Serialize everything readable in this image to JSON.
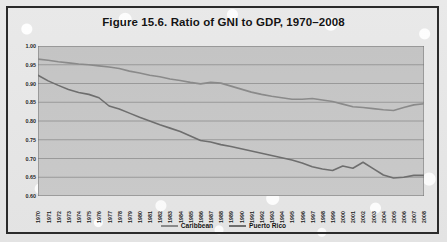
{
  "figure": {
    "title": "Figure 15.6. Ratio of GNI to GDP, 1970–2008",
    "border_color": "#2b2b2b",
    "plot_band_color": "#c6c6c6"
  },
  "legend": {
    "position": "bottom-center",
    "items": [
      {
        "label": "Caribbean",
        "color": "#8a8a8a"
      },
      {
        "label": "Puerto Rico",
        "color": "#6e6e6e"
      }
    ]
  },
  "chart_data": {
    "type": "line",
    "title": "Figure 15.6. Ratio of GNI to GDP, 1970–2008",
    "xlabel": "",
    "ylabel": "",
    "ylim": [
      0.6,
      1.0
    ],
    "ytick_step": 0.05,
    "ytick_labels": [
      "1.00",
      "0.95",
      "0.90",
      "0.85",
      "0.80",
      "0.75",
      "0.70",
      "0.65",
      "0.60"
    ],
    "grid": true,
    "legend_position": "bottom-center",
    "x": [
      1970,
      1971,
      1972,
      1973,
      1974,
      1975,
      1976,
      1977,
      1978,
      1979,
      1980,
      1981,
      1982,
      1983,
      1984,
      1985,
      1986,
      1987,
      1988,
      1989,
      1990,
      1991,
      1992,
      1993,
      1994,
      1995,
      1996,
      1997,
      1998,
      1999,
      2000,
      2001,
      2002,
      2003,
      2004,
      2005,
      2006,
      2007,
      2008
    ],
    "xtick_labels": [
      "1970",
      "1971",
      "1972",
      "1973",
      "1974",
      "1975",
      "1976",
      "1977",
      "1978",
      "1979",
      "1980",
      "1981",
      "1982",
      "1983",
      "1984",
      "1985",
      "1986",
      "1987",
      "1988",
      "1989",
      "1990",
      "1991",
      "1992",
      "1993",
      "1994",
      "1995",
      "1996",
      "1997",
      "1998",
      "1999",
      "2000",
      "2001",
      "2002",
      "2003",
      "2004",
      "2005",
      "2006",
      "2007",
      "2008"
    ],
    "series": [
      {
        "name": "Caribbean",
        "color": "#8a8a8a",
        "values": [
          0.965,
          0.962,
          0.958,
          0.955,
          0.952,
          0.95,
          0.947,
          0.944,
          0.94,
          0.933,
          0.928,
          0.922,
          0.918,
          0.912,
          0.908,
          0.903,
          0.899,
          0.903,
          0.901,
          0.893,
          0.885,
          0.877,
          0.871,
          0.866,
          0.862,
          0.858,
          0.858,
          0.86,
          0.856,
          0.852,
          0.845,
          0.838,
          0.836,
          0.833,
          0.83,
          0.828,
          0.836,
          0.843,
          0.846
        ]
      },
      {
        "name": "Puerto Rico",
        "color": "#6e6e6e",
        "values": [
          0.922,
          0.907,
          0.895,
          0.884,
          0.876,
          0.871,
          0.862,
          0.84,
          0.832,
          0.821,
          0.81,
          0.8,
          0.79,
          0.781,
          0.772,
          0.76,
          0.748,
          0.744,
          0.737,
          0.732,
          0.726,
          0.72,
          0.714,
          0.708,
          0.702,
          0.696,
          0.688,
          0.678,
          0.672,
          0.668,
          0.68,
          0.674,
          0.69,
          0.673,
          0.656,
          0.648,
          0.65,
          0.655,
          0.655
        ]
      }
    ]
  }
}
